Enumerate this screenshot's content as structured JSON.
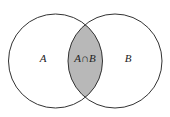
{
  "diagram": {
    "type": "venn",
    "sets": [
      {
        "label": "A"
      },
      {
        "label": "B"
      }
    ],
    "intersection": {
      "label": "A∩B",
      "fill": "#b8b8b8"
    },
    "stroke": "#333333",
    "background": "#ffffff"
  }
}
